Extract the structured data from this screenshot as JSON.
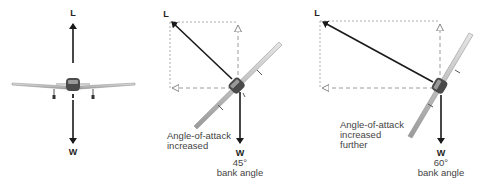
{
  "diagram": {
    "panels": [
      {
        "id": "level",
        "lift_label": "L",
        "weight_label": "W"
      },
      {
        "id": "bank45",
        "lift_label": "L",
        "weight_label": "W",
        "note_lines": [
          "Angle-of-attack",
          "increased"
        ],
        "bank_value": "45°",
        "bank_label": "bank angle"
      },
      {
        "id": "bank60",
        "lift_label": "L",
        "weight_label": "W",
        "note_lines": [
          "Angle-of-attack",
          "increased",
          "further"
        ],
        "bank_value": "60°",
        "bank_label": "bank angle"
      }
    ],
    "colors": {
      "arrow": "#1a1a1a",
      "dashed": "#9a9a9a",
      "wing": "#bdbdbd",
      "fuselage": "#555555"
    }
  }
}
